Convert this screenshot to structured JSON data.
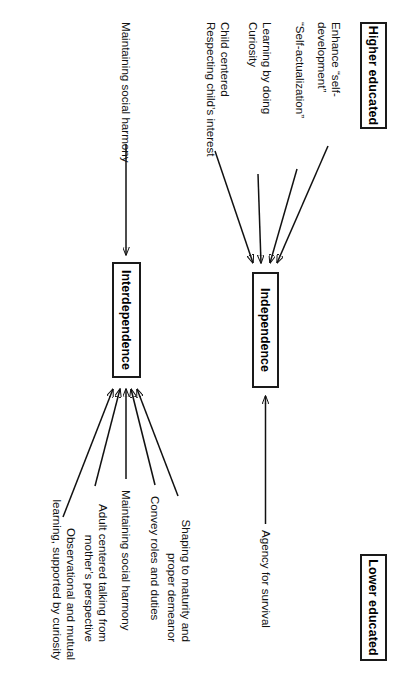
{
  "figure": {
    "type": "diagram",
    "orientation": "rotated-90-ccw"
  },
  "labels": {
    "higher_educated": "Higher educated",
    "lower_educated": "Lower educated"
  },
  "boxes": {
    "independence": "Independence",
    "interdependence": "Interdependence"
  },
  "independence_row": {
    "higher_side": [
      "Enhance “self-development”",
      "“Self-actualization”",
      "Learning by doing\nCuriosity",
      "Child centered\nRespecting child’s interest"
    ],
    "lower_side": [
      "Agency for survival"
    ]
  },
  "interdependence_row": {
    "higher_side": [
      "Maintaining social harmony"
    ],
    "lower_side": [
      "Shaping to maturity and\nproper demeanor",
      "Convey roles and duties",
      "Maintaining social harmony",
      "Adult centered talking from\nmother’s perspective",
      "Observational and mutual\nlearning, supported by curiosity"
    ]
  },
  "colors": {
    "stroke": "#111111",
    "background": "#ffffff",
    "box_border": "#1a1a1a"
  }
}
